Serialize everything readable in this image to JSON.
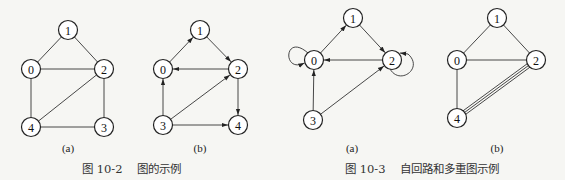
{
  "figures": [
    {
      "id": "fig-10-2",
      "caption_number": "图 10-2",
      "caption_text": "图的示例",
      "caption_x": 82,
      "subfigures": [
        {
          "label": "(a)",
          "label_pos": [
            68,
            152
          ],
          "directed": false,
          "nodes": [
            {
              "id": "1",
              "x": 68,
              "y": 30
            },
            {
              "id": "0",
              "x": 31,
              "y": 69
            },
            {
              "id": "2",
              "x": 104,
              "y": 69
            },
            {
              "id": "4",
              "x": 31,
              "y": 127
            },
            {
              "id": "3",
              "x": 104,
              "y": 127
            }
          ],
          "edges": [
            [
              "0",
              "1"
            ],
            [
              "1",
              "2"
            ],
            [
              "0",
              "2"
            ],
            [
              "0",
              "4"
            ],
            [
              "2",
              "4"
            ],
            [
              "2",
              "3"
            ],
            [
              "4",
              "3"
            ]
          ]
        },
        {
          "label": "(b)",
          "label_pos": [
            200,
            152
          ],
          "directed": true,
          "nodes": [
            {
              "id": "1",
              "x": 200,
              "y": 30
            },
            {
              "id": "0",
              "x": 163,
              "y": 69
            },
            {
              "id": "2",
              "x": 238,
              "y": 69
            },
            {
              "id": "3",
              "x": 163,
              "y": 125
            },
            {
              "id": "4",
              "x": 238,
              "y": 125
            }
          ],
          "edges": [
            [
              "0",
              "1"
            ],
            [
              "1",
              "2"
            ],
            [
              "2",
              "0"
            ],
            [
              "2",
              "4"
            ],
            [
              "3",
              "0"
            ],
            [
              "3",
              "2"
            ],
            [
              "3",
              "4"
            ]
          ]
        }
      ]
    },
    {
      "id": "fig-10-3",
      "caption_number": "图 10-3",
      "caption_text": "自回路和多重图示例",
      "caption_x": 345,
      "subfigures": [
        {
          "label": "(a)",
          "label_pos": [
            352,
            152
          ],
          "directed": true,
          "nodes": [
            {
              "id": "1",
              "x": 353,
              "y": 18
            },
            {
              "id": "0",
              "x": 314,
              "y": 60
            },
            {
              "id": "2",
              "x": 392,
              "y": 60
            },
            {
              "id": "3",
              "x": 313,
              "y": 120
            }
          ],
          "edges": [
            [
              "0",
              "1"
            ],
            [
              "1",
              "2"
            ],
            [
              "2",
              "0"
            ],
            [
              "3",
              "0"
            ],
            [
              "3",
              "2"
            ]
          ],
          "self_loops": [
            {
              "node": "0",
              "side": "left"
            },
            {
              "node": "2",
              "side": "right"
            }
          ]
        },
        {
          "label": "(b)",
          "label_pos": [
            497,
            152
          ],
          "directed": false,
          "nodes": [
            {
              "id": "1",
              "x": 497,
              "y": 18
            },
            {
              "id": "0",
              "x": 457,
              "y": 60
            },
            {
              "id": "2",
              "x": 536,
              "y": 60
            },
            {
              "id": "4",
              "x": 457,
              "y": 118
            }
          ],
          "edges": [
            [
              "0",
              "1"
            ],
            [
              "1",
              "2"
            ],
            [
              "0",
              "2"
            ],
            [
              "0",
              "4"
            ]
          ],
          "multi_edges": [
            {
              "from": "2",
              "to": "4",
              "count": 3
            }
          ]
        }
      ]
    }
  ],
  "style": {
    "node_radius": 9.5,
    "line_color": "#333333",
    "background": "#f6f6f3"
  }
}
